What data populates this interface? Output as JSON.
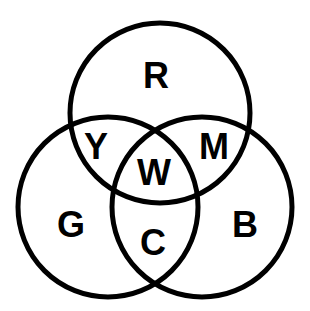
{
  "diagram": {
    "type": "venn",
    "colors": {
      "stroke": "#000000",
      "background": "#ffffff"
    },
    "sets": [
      {
        "id": "red",
        "label": "R"
      },
      {
        "id": "green",
        "label": "G"
      },
      {
        "id": "blue",
        "label": "B"
      }
    ],
    "regions": [
      {
        "id": "red-only",
        "sets": [
          "red"
        ],
        "label": "R"
      },
      {
        "id": "green-only",
        "sets": [
          "green"
        ],
        "label": "G"
      },
      {
        "id": "blue-only",
        "sets": [
          "blue"
        ],
        "label": "B"
      },
      {
        "id": "red-green",
        "sets": [
          "red",
          "green"
        ],
        "label": "Y"
      },
      {
        "id": "red-blue",
        "sets": [
          "red",
          "blue"
        ],
        "label": "M"
      },
      {
        "id": "green-blue",
        "sets": [
          "green",
          "blue"
        ],
        "label": "C"
      },
      {
        "id": "all",
        "sets": [
          "red",
          "green",
          "blue"
        ],
        "label": "W"
      }
    ]
  }
}
